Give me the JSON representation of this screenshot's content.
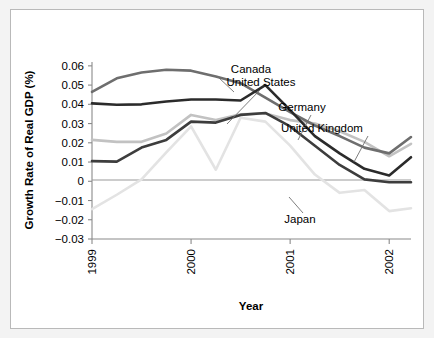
{
  "chart_data": {
    "type": "line",
    "title": "",
    "xlabel": "Year",
    "ylabel": "Growth Rate of Real GDP (%)",
    "xlim": [
      1999.0,
      2002.22
    ],
    "ylim": [
      -0.03,
      0.062
    ],
    "grid": false,
    "legend_position": "inline-annotations",
    "x_tick_labels": [
      "1999",
      "2000",
      "2001",
      "2002"
    ],
    "x_tick_values": [
      1999,
      2000,
      2001,
      2002
    ],
    "y_tick_labels": [
      "0.06",
      "0.05",
      "0.04",
      "0.03",
      "0.02",
      "0.01",
      "0",
      "-0.01",
      "-0.02",
      "-0.03"
    ],
    "y_tick_values": [
      0.06,
      0.05,
      0.04,
      0.03,
      0.02,
      0.01,
      0,
      -0.01,
      -0.02,
      -0.03
    ],
    "x": [
      1999.0,
      1999.25,
      1999.5,
      1999.75,
      2000.0,
      2000.25,
      2000.5,
      2000.75,
      2001.0,
      2001.25,
      2001.5,
      2001.75,
      2002.0,
      2002.22
    ],
    "series": [
      {
        "name": "Canada",
        "color": "#6e6e6e",
        "values": [
          0.0465,
          0.0535,
          0.0565,
          0.058,
          0.0575,
          0.0545,
          0.051,
          0.0435,
          0.036,
          0.029,
          0.0235,
          0.0175,
          0.0145,
          0.023
        ]
      },
      {
        "name": "United States",
        "color": "#2b2b2b",
        "values": [
          0.0405,
          0.0398,
          0.04,
          0.0415,
          0.0425,
          0.0425,
          0.042,
          0.05,
          0.037,
          0.0235,
          0.0145,
          0.0065,
          0.003,
          0.0125
        ]
      },
      {
        "name": "Germany",
        "color": "#3d3d3d",
        "values": [
          0.0105,
          0.0102,
          0.0175,
          0.0215,
          0.031,
          0.0305,
          0.0345,
          0.0355,
          0.0285,
          0.0185,
          0.0085,
          0.001,
          -0.0005,
          -0.0005
        ]
      },
      {
        "name": "United Kingdom",
        "color": "#c2c2c2",
        "values": [
          0.0215,
          0.0205,
          0.0205,
          0.0248,
          0.0345,
          0.0318,
          0.0348,
          0.0352,
          0.0318,
          0.03,
          0.026,
          0.0205,
          0.013,
          0.0195
        ]
      },
      {
        "name": "Japan",
        "color": "#e3e3e3",
        "values": [
          -0.0145,
          -0.007,
          0.001,
          0.015,
          0.0285,
          0.006,
          0.033,
          0.031,
          0.0185,
          0.0035,
          -0.006,
          -0.0045,
          -0.0155,
          -0.014
        ]
      }
    ],
    "annotations": [
      {
        "label": "Canada",
        "x": 240,
        "y": 63,
        "leader": [
          [
            207,
            67
          ],
          [
            223,
            82
          ]
        ]
      },
      {
        "label": "United States",
        "x": 250,
        "y": 76,
        "leader": [
          [
            249,
            80
          ],
          [
            216,
            114
          ]
        ]
      },
      {
        "label": "Germany",
        "x": 291,
        "y": 101,
        "leader": [
          [
            300,
            105
          ],
          [
            287,
            130
          ]
        ]
      },
      {
        "label": "United Kingdom",
        "x": 311,
        "y": 122,
        "leader": [
          [
            357,
            126
          ],
          [
            343,
            152
          ]
        ]
      },
      {
        "label": "Japan",
        "x": 289,
        "y": 213,
        "leader": [
          [
            292,
            203
          ],
          [
            278,
            187
          ]
        ]
      }
    ]
  }
}
